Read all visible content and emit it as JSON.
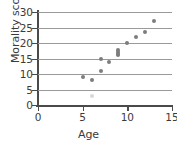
{
  "chart_data": {
    "type": "scatter",
    "title": "",
    "xlabel": "Age",
    "ylabel": "Morality score",
    "xlim": [
      0,
      15
    ],
    "ylim": [
      0,
      30
    ],
    "xticks": [
      0,
      5,
      10,
      15
    ],
    "yticks": [
      0,
      5,
      10,
      15,
      20,
      25,
      30
    ],
    "grid": "horizontal",
    "legend": "none",
    "marker_color": "#7d7d7d",
    "gridline_color": "#9a9a9a",
    "axis_color": "#4a4a4a",
    "background_color": "#ffffff",
    "points": [
      {
        "x": 5,
        "y": 9,
        "faint": false
      },
      {
        "x": 6,
        "y": 8,
        "faint": false
      },
      {
        "x": 6,
        "y": 3,
        "faint": true
      },
      {
        "x": 7,
        "y": 11,
        "faint": false
      },
      {
        "x": 7,
        "y": 15,
        "faint": false
      },
      {
        "x": 8,
        "y": 14,
        "faint": false
      },
      {
        "x": 9,
        "y": 16,
        "faint": false
      },
      {
        "x": 9,
        "y": 16.6,
        "faint": false
      },
      {
        "x": 9,
        "y": 17.2,
        "faint": false
      },
      {
        "x": 9,
        "y": 17.8,
        "faint": false
      },
      {
        "x": 10,
        "y": 20,
        "faint": false
      },
      {
        "x": 11,
        "y": 22,
        "faint": false
      },
      {
        "x": 12,
        "y": 23.5,
        "faint": false
      },
      {
        "x": 13,
        "y": 27,
        "faint": false
      }
    ]
  }
}
